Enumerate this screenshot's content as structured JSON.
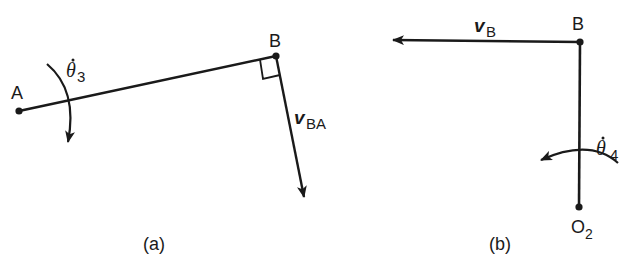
{
  "colors": {
    "ink": "#1a1a1a",
    "background": "#ffffff"
  },
  "panel_a": {
    "caption": "(a)",
    "point_A": {
      "label": "A",
      "x": 19,
      "y": 111
    },
    "point_B": {
      "label": "B",
      "x": 276,
      "y": 56
    },
    "angular_velocity": {
      "symbol": "θ",
      "dot": "˙",
      "subscript": "3",
      "direction": "clockwise"
    },
    "velocity_vector": {
      "symbol": "v",
      "subscript": "BA",
      "direction": "perpendicular to AB"
    },
    "right_angle_marker": true
  },
  "panel_b": {
    "caption": "(b)",
    "point_B": {
      "label": "B",
      "x": 580,
      "y": 42
    },
    "point_O2": {
      "label": "O",
      "subscript": "2",
      "x": 579,
      "y": 207
    },
    "angular_velocity": {
      "symbol": "θ",
      "dot": "˙",
      "subscript": "4",
      "direction": "counterclockwise"
    },
    "velocity_vector": {
      "symbol": "v",
      "subscript": "B",
      "direction": "left"
    }
  }
}
